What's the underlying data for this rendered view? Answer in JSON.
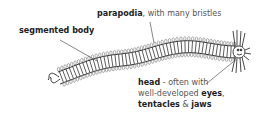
{
  "diagram": {
    "colors": {
      "ink": "#333333",
      "label": "#555555",
      "bold": "#222222",
      "background": "#ffffff"
    },
    "labels": {
      "parapodia": {
        "bold": "parapodia",
        "rest": ", with many bristles"
      },
      "segmented_body": {
        "bold": "segmented body"
      },
      "head": {
        "line1_bold": "head",
        "line1_rest": " - often with",
        "line2_rest": "well-developed ",
        "line2_bold": "eyes",
        "line2_tail": ",",
        "line3_bold": "tentacles",
        "line3_mid": " & ",
        "line3_bold2": "jaws"
      }
    }
  }
}
